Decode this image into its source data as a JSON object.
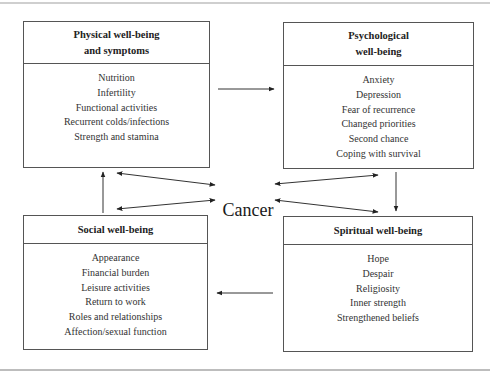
{
  "diagram": {
    "center": {
      "label": "Cancer"
    },
    "boxes": {
      "physical": {
        "title_lines": [
          "Physical well-being",
          "and symptoms"
        ],
        "items": [
          "Nutrition",
          "Infertility",
          "Functional activities",
          "Recurrent colds/infections",
          "Strength and stamina"
        ]
      },
      "psychological": {
        "title_lines": [
          "Psychological",
          "well-being"
        ],
        "items": [
          "Anxiety",
          "Depression",
          "Fear of recurrence",
          "Changed priorities",
          "Second chance",
          "Coping with survival"
        ]
      },
      "social": {
        "title_lines": [
          "Social well-being"
        ],
        "items": [
          "Appearance",
          "Financial burden",
          "Leisure activities",
          "Return to work",
          "Roles and relationships",
          "Affection/sexual function"
        ]
      },
      "spiritual": {
        "title_lines": [
          "Spiritual well-being"
        ],
        "items": [
          "Hope",
          "Despair",
          "Religiosity",
          "Inner strength",
          "Strengthened beliefs"
        ]
      }
    },
    "connections": [
      {
        "from": "physical",
        "to": "psychological",
        "direction": "one-way"
      },
      {
        "from": "psychological",
        "to": "spiritual",
        "direction": "one-way"
      },
      {
        "from": "spiritual",
        "to": "social",
        "direction": "one-way"
      },
      {
        "from": "social",
        "to": "physical",
        "direction": "one-way"
      },
      {
        "from": "cancer",
        "to": "physical",
        "direction": "two-way"
      },
      {
        "from": "cancer",
        "to": "psychological",
        "direction": "two-way"
      },
      {
        "from": "cancer",
        "to": "social",
        "direction": "two-way"
      },
      {
        "from": "cancer",
        "to": "spiritual",
        "direction": "two-way"
      }
    ]
  }
}
